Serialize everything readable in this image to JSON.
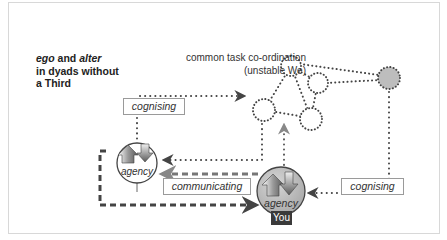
{
  "title": {
    "line1_italic_a": "ego",
    "line1_mid": " and ",
    "line1_italic_b": "alter",
    "line2": "in dyads without",
    "line3": "a Third"
  },
  "caption": {
    "line1": "common task co-ordination",
    "line2": "(unstable We)"
  },
  "labels": {
    "cognising_left": "cognising",
    "communicating": "communicating",
    "cognising_right": "cognising"
  },
  "agents": {
    "alter": {
      "label": "agency"
    },
    "ego": {
      "label": "agency",
      "tag": "You"
    }
  },
  "network": {
    "nodes": [
      {
        "id": "top",
        "fill": "#ffffff"
      },
      {
        "id": "mid-right",
        "fill": "#ffffff"
      },
      {
        "id": "left",
        "fill": "#ffffff"
      },
      {
        "id": "bottom",
        "fill": "#ffffff"
      },
      {
        "id": "external",
        "fill": "#bdbdbd"
      }
    ]
  },
  "colors": {
    "line": "#444444",
    "ego_fill": "#b5b5b5",
    "you_tag": "#3a3a3a",
    "frame": "#d8d8d8"
  }
}
